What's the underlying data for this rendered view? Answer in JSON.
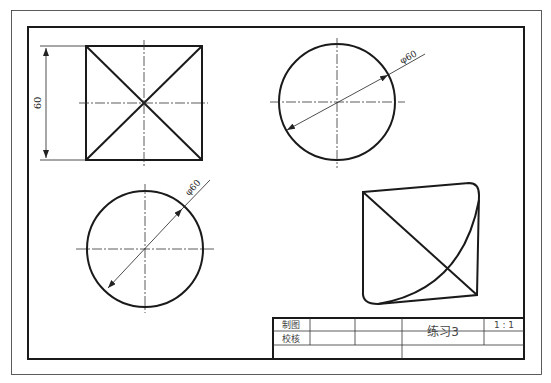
{
  "drawing": {
    "views": [
      {
        "name": "square-with-diagonals",
        "dimension": "60"
      },
      {
        "name": "circle-top-right",
        "dimension": "φ60"
      },
      {
        "name": "circle-bottom-left",
        "dimension": "φ60"
      },
      {
        "name": "skewed-quadrilateral-with-curve"
      }
    ]
  },
  "title_block": {
    "row1_label": "制图",
    "row2_label": "校核",
    "title": "练习3",
    "scale": "1 : 1"
  },
  "colors": {
    "line": "#1a1a1a",
    "background": "#ffffff"
  }
}
